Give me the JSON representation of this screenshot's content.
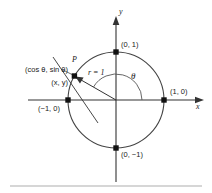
{
  "figure": {
    "type": "unit-circle-diagram",
    "stroke_color": "#333333",
    "text_color": "#1a1a1a",
    "rule_color": "#c8c8c8",
    "axes": {
      "x_name": "x",
      "y_name": "y"
    },
    "circle": {
      "center_x": 116,
      "center_y": 100,
      "radius_px": 48,
      "radius_label": "r = 1"
    },
    "angle": {
      "label": "θ",
      "degrees": 150,
      "arc_radius_px": 26
    },
    "point_p": {
      "name": "P",
      "coord_label_trig": "(cos θ, sin θ)",
      "coord_label_xy": "(x, y)",
      "x_px": 74.4,
      "y_px": 76.0
    },
    "axis_points": [
      {
        "label": "(0, 1)",
        "x_px": 116,
        "y_px": 52
      },
      {
        "label": "(1, 0)",
        "x_px": 164,
        "y_px": 100
      },
      {
        "label": "(−1, 0)",
        "x_px": 68,
        "y_px": 100
      },
      {
        "label": "(0, −1)",
        "x_px": 116,
        "y_px": 148
      }
    ]
  }
}
